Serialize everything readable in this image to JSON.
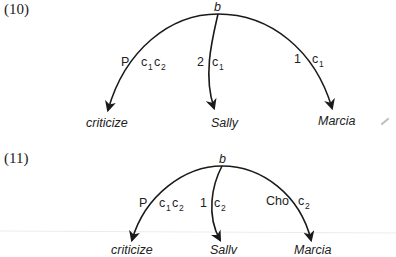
{
  "diagrams": [
    {
      "number": "(10)",
      "root": "b",
      "edges": [
        {
          "left_label": "P",
          "right_label": "c",
          "right_sub1": "1",
          "right_label2": "c",
          "right_sub2": "2",
          "target": "criticize"
        },
        {
          "left_label": "2",
          "right_label": "c",
          "right_sub1": "1",
          "target": "Sally"
        },
        {
          "left_label": "1",
          "right_label": "c",
          "right_sub1": "1",
          "target": "Marcia"
        }
      ]
    },
    {
      "number": "(11)",
      "root": "b",
      "edges": [
        {
          "left_label": "P",
          "right_label": "c",
          "right_sub1": "1",
          "right_label2": "c",
          "right_sub2": "2",
          "target": "criticize"
        },
        {
          "left_label": "1",
          "right_label": "c",
          "right_sub1": "2",
          "target": "Sallv"
        },
        {
          "left_label": "Cho",
          "right_label": "c",
          "right_sub1": "2",
          "target": "Marcia"
        }
      ]
    }
  ],
  "colors": {
    "ink": "#1a1a1a",
    "mark": "#b8b8b8",
    "rule": "#ececec"
  }
}
